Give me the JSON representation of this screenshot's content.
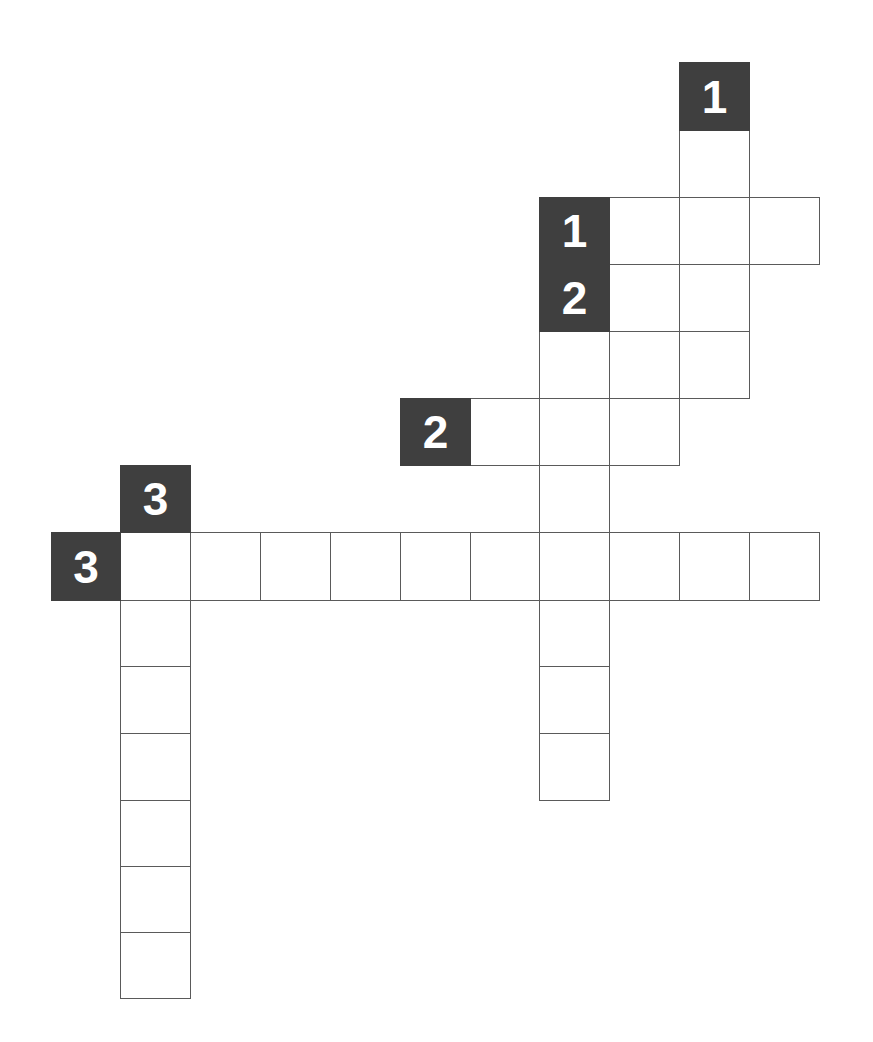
{
  "puzzle": {
    "type": "crossword",
    "colors": {
      "clue_bg": "#3f3f3f",
      "clue_text": "#ffffff",
      "cell_border": "#5a5a5a",
      "cell_bg": "#ffffff"
    },
    "grid": {
      "col_edges": [
        51,
        120,
        190,
        260,
        330,
        400,
        470,
        539,
        609,
        679,
        749,
        819
      ],
      "row_edges": [
        62,
        130,
        197,
        264,
        331,
        398,
        465,
        532,
        600,
        666,
        733,
        800,
        866,
        932,
        998
      ]
    },
    "clues": [
      {
        "number": "1",
        "direction": "down",
        "marker": {
          "col": 9,
          "row": 0
        },
        "cells": [
          [
            9,
            1
          ],
          [
            9,
            2
          ],
          [
            9,
            3
          ],
          [
            9,
            4
          ]
        ]
      },
      {
        "number": "1",
        "direction": "across",
        "marker": {
          "col": 7,
          "row": 2
        },
        "cells": [
          [
            8,
            2
          ],
          [
            9,
            2
          ],
          [
            10,
            2
          ]
        ]
      },
      {
        "number": "2",
        "direction": "down",
        "marker": {
          "col": 7,
          "row": 3
        },
        "cells": [
          [
            7,
            4
          ],
          [
            7,
            5
          ],
          [
            7,
            6
          ],
          [
            7,
            7
          ],
          [
            7,
            8
          ],
          [
            7,
            9
          ],
          [
            7,
            10
          ]
        ]
      },
      {
        "number": "2",
        "direction": "across",
        "marker": {
          "col": 5,
          "row": 5
        },
        "cells": [
          [
            6,
            5
          ],
          [
            7,
            5
          ],
          [
            8,
            5
          ]
        ]
      },
      {
        "number": "3",
        "direction": "down",
        "marker": {
          "col": 1,
          "row": 6
        },
        "cells": [
          [
            1,
            7
          ],
          [
            1,
            8
          ],
          [
            1,
            9
          ],
          [
            1,
            10
          ],
          [
            1,
            11
          ],
          [
            1,
            12
          ],
          [
            1,
            13
          ]
        ]
      },
      {
        "number": "3",
        "direction": "across",
        "marker": {
          "col": 0,
          "row": 7
        },
        "cells": [
          [
            1,
            7
          ],
          [
            2,
            7
          ],
          [
            3,
            7
          ],
          [
            4,
            7
          ],
          [
            5,
            7
          ],
          [
            6,
            7
          ],
          [
            7,
            7
          ],
          [
            8,
            7
          ],
          [
            9,
            7
          ],
          [
            10,
            7
          ]
        ]
      }
    ],
    "extra_cells": [
      [
        8,
        3
      ],
      [
        8,
        4
      ]
    ]
  }
}
